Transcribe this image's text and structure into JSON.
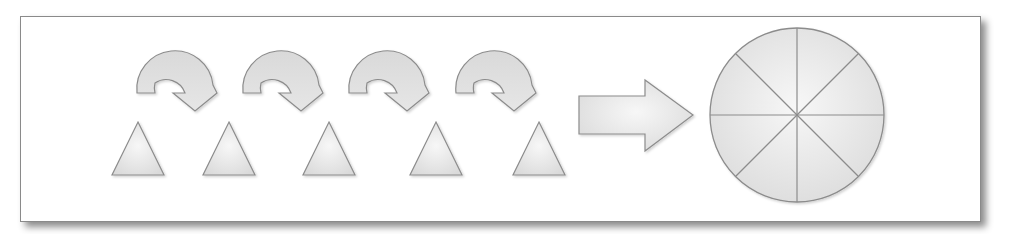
{
  "diagram": {
    "colors": {
      "shape_fill_light": "#f4f4f4",
      "shape_fill_dark": "#dcdcdc",
      "shape_stroke": "#8c8c8c",
      "frame_border": "#8a8a8a",
      "background": "#ffffff"
    },
    "triangles": [
      {
        "id": "triangle-1",
        "apex_x": 138
      },
      {
        "id": "triangle-2",
        "apex_x": 229
      },
      {
        "id": "triangle-3",
        "apex_x": 329
      },
      {
        "id": "triangle-4",
        "apex_x": 436
      },
      {
        "id": "triangle-5",
        "apex_x": 539
      }
    ],
    "curved_arrows": [
      {
        "id": "curved-arrow-1",
        "x": 137
      },
      {
        "id": "curved-arrow-2",
        "x": 243
      },
      {
        "id": "curved-arrow-3",
        "x": 349
      },
      {
        "id": "curved-arrow-4",
        "x": 456
      }
    ],
    "block_arrow": {
      "id": "block-arrow",
      "direction": "right"
    },
    "circle": {
      "id": "pie-circle",
      "slices": 8
    }
  }
}
